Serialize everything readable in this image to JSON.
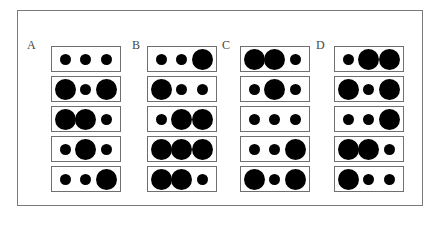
{
  "figure": {
    "colors": {
      "frame": "#7a7a7a",
      "box_border": "#6f6f6f",
      "dot": "#000000",
      "background": "#ffffff"
    },
    "groups": [
      {
        "label": "A",
        "rows": [
          [
            "small",
            "small",
            "small"
          ],
          [
            "large",
            "small",
            "large"
          ],
          [
            "large",
            "large",
            "small"
          ],
          [
            "small",
            "large",
            "small"
          ],
          [
            "small",
            "small",
            "large"
          ]
        ]
      },
      {
        "label": "B",
        "rows": [
          [
            "small",
            "small",
            "large"
          ],
          [
            "large",
            "small",
            "small"
          ],
          [
            "small",
            "large",
            "large"
          ],
          [
            "large",
            "large",
            "large"
          ],
          [
            "large",
            "large",
            "small"
          ]
        ]
      },
      {
        "label": "C",
        "rows": [
          [
            "large",
            "large",
            "small"
          ],
          [
            "small",
            "large",
            "small"
          ],
          [
            "small",
            "small",
            "small"
          ],
          [
            "small",
            "small",
            "large"
          ],
          [
            "large",
            "small",
            "large"
          ]
        ]
      },
      {
        "label": "D",
        "rows": [
          [
            "small",
            "large",
            "large"
          ],
          [
            "large",
            "small",
            "large"
          ],
          [
            "small",
            "small",
            "large"
          ],
          [
            "large",
            "large",
            "small"
          ],
          [
            "large",
            "small",
            "small"
          ]
        ]
      }
    ]
  }
}
